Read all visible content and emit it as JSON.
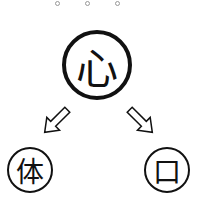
{
  "diagram": {
    "top_dots": [
      {
        "x": 57,
        "y": 3
      },
      {
        "x": 87,
        "y": 3
      },
      {
        "x": 117,
        "y": 3
      }
    ],
    "root": {
      "label": "心"
    },
    "children": [
      {
        "label": "体",
        "position": "left"
      },
      {
        "label": "口",
        "position": "right"
      }
    ],
    "arrows": [
      {
        "from": "心",
        "to": "体",
        "style": "hollow"
      },
      {
        "from": "心",
        "to": "口",
        "style": "hollow"
      }
    ],
    "colors": {
      "stroke": "#111111",
      "background": "#ffffff",
      "dot": "#999999"
    }
  }
}
